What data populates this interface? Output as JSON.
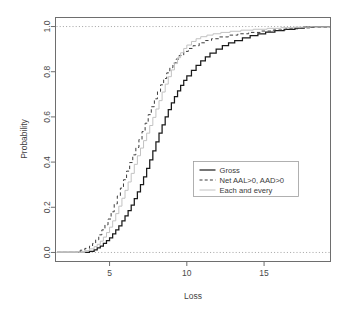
{
  "chart_data": {
    "type": "line",
    "title": "",
    "subtitle": "",
    "xlabel": "Loss",
    "ylabel": "Probability",
    "xlim": [
      1.5,
      19.3
    ],
    "ylim": [
      -0.04,
      1.04
    ],
    "xticks": [
      5,
      10,
      15
    ],
    "xticklabels": [
      "5",
      "10",
      "15"
    ],
    "yticks": [
      0.0,
      0.2,
      0.4,
      0.6,
      0.8,
      1.0
    ],
    "yticklabels": [
      "0.0",
      "0.2",
      "0.4",
      "0.6",
      "0.8",
      "1.0"
    ],
    "grid": false,
    "reference_lines": [
      {
        "axis": "y",
        "value": 0.0,
        "style": "dotted",
        "color": "#9a9a9a"
      },
      {
        "axis": "y",
        "value": 1.0,
        "style": "dotted",
        "color": "#9a9a9a"
      }
    ],
    "legend": {
      "position": "center-right",
      "entries": [
        {
          "name": "Gross",
          "style": "solid",
          "color": "#1a1a1a",
          "width": 1.2
        },
        {
          "name": "Net AAL>0, AAD>0",
          "style": "dashed",
          "color": "#3c3c3c",
          "width": 1.0
        },
        {
          "name": "Each and every",
          "style": "solid",
          "color": "#c2c2c2",
          "width": 1.0
        }
      ]
    },
    "series": [
      {
        "name": "Gross",
        "style": "solid",
        "color": "#1a1a1a",
        "x": [
          1.6,
          3.3,
          3.7,
          4.0,
          4.2,
          4.4,
          4.6,
          4.8,
          5.0,
          5.2,
          5.4,
          5.6,
          5.8,
          6.0,
          6.2,
          6.4,
          6.6,
          6.8,
          7.0,
          7.2,
          7.4,
          7.6,
          7.8,
          8.0,
          8.2,
          8.4,
          8.6,
          8.8,
          9.0,
          9.2,
          9.4,
          9.6,
          9.8,
          10.0,
          10.3,
          10.6,
          10.9,
          11.2,
          11.5,
          11.9,
          12.3,
          12.7,
          13.1,
          13.6,
          14.1,
          14.6,
          15.1,
          15.7,
          16.3,
          17.0,
          17.6,
          18.2,
          19.3
        ],
        "y": [
          0.0,
          0.0,
          0.005,
          0.012,
          0.02,
          0.028,
          0.04,
          0.052,
          0.065,
          0.082,
          0.1,
          0.118,
          0.14,
          0.162,
          0.185,
          0.21,
          0.238,
          0.268,
          0.3,
          0.335,
          0.372,
          0.41,
          0.45,
          0.49,
          0.528,
          0.565,
          0.6,
          0.632,
          0.662,
          0.69,
          0.715,
          0.74,
          0.762,
          0.782,
          0.806,
          0.828,
          0.848,
          0.866,
          0.882,
          0.9,
          0.915,
          0.928,
          0.938,
          0.95,
          0.96,
          0.968,
          0.975,
          0.982,
          0.988,
          0.993,
          0.997,
          1.0,
          1.0
        ]
      },
      {
        "name": "Net AAL>0, AAD>0",
        "style": "dashed",
        "color": "#3c3c3c",
        "x": [
          1.6,
          2.8,
          3.1,
          3.4,
          3.7,
          3.9,
          4.1,
          4.3,
          4.5,
          4.7,
          4.9,
          5.1,
          5.3,
          5.5,
          5.7,
          5.9,
          6.1,
          6.3,
          6.5,
          6.7,
          6.9,
          7.1,
          7.3,
          7.5,
          7.7,
          7.9,
          8.1,
          8.3,
          8.5,
          8.7,
          8.9,
          9.1,
          9.3,
          9.5,
          9.8,
          10.1,
          10.4,
          10.8,
          11.2,
          11.6,
          12.1,
          12.7,
          13.3,
          14.0,
          14.8,
          15.6,
          16.4,
          17.2,
          18.0,
          19.3
        ],
        "y": [
          0.0,
          0.0,
          0.01,
          0.018,
          0.028,
          0.04,
          0.056,
          0.078,
          0.1,
          0.122,
          0.148,
          0.18,
          0.215,
          0.25,
          0.285,
          0.322,
          0.36,
          0.398,
          0.432,
          0.465,
          0.5,
          0.535,
          0.572,
          0.61,
          0.645,
          0.68,
          0.712,
          0.742,
          0.77,
          0.795,
          0.818,
          0.838,
          0.856,
          0.872,
          0.89,
          0.903,
          0.915,
          0.928,
          0.938,
          0.946,
          0.954,
          0.962,
          0.968,
          0.974,
          0.98,
          0.985,
          0.99,
          0.994,
          0.998,
          1.0
        ]
      },
      {
        "name": "Each and every",
        "style": "solid",
        "color": "#c2c2c2",
        "x": [
          1.6,
          3.0,
          3.4,
          3.7,
          4.0,
          4.2,
          4.4,
          4.6,
          4.8,
          5.0,
          5.2,
          5.4,
          5.6,
          5.8,
          6.0,
          6.2,
          6.4,
          6.6,
          6.8,
          7.0,
          7.2,
          7.4,
          7.6,
          7.8,
          8.0,
          8.2,
          8.4,
          8.6,
          8.8,
          9.0,
          9.2,
          9.4,
          9.6,
          9.8,
          10.0,
          10.3,
          10.6,
          10.9,
          11.3,
          11.7,
          12.2,
          12.8,
          13.5,
          14.3,
          15.2,
          16.1,
          17.0,
          18.0,
          19.3
        ],
        "y": [
          0.0,
          0.0,
          0.008,
          0.016,
          0.026,
          0.036,
          0.05,
          0.068,
          0.088,
          0.112,
          0.14,
          0.172,
          0.205,
          0.24,
          0.275,
          0.312,
          0.35,
          0.39,
          0.428,
          0.462,
          0.495,
          0.528,
          0.562,
          0.598,
          0.635,
          0.672,
          0.71,
          0.745,
          0.778,
          0.808,
          0.836,
          0.862,
          0.884,
          0.903,
          0.918,
          0.934,
          0.946,
          0.955,
          0.962,
          0.968,
          0.974,
          0.979,
          0.984,
          0.988,
          0.992,
          0.995,
          0.997,
          0.999,
          1.0
        ]
      }
    ]
  }
}
